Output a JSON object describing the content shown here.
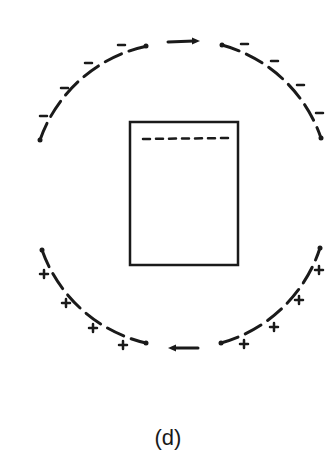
{
  "figure": {
    "caption": "(d)",
    "colors": {
      "ink": "#1a1a1a",
      "background": "#ffffff"
    },
    "upper_arc": {
      "charge_sign": "−",
      "charge_count": 9,
      "arrow_direction": "right"
    },
    "lower_arc": {
      "charge_sign": "+",
      "charge_count": 8,
      "arrow_direction": "left"
    },
    "plate": {
      "shape": "rectangle",
      "inner_marking": "dashed-line"
    }
  }
}
